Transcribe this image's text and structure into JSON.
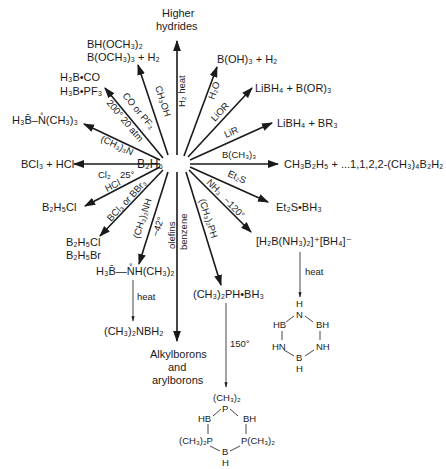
{
  "diagram": {
    "center": "B₂H₆",
    "accent_color": "#1a1a1a",
    "background_color": "#ffffff",
    "reactions": [
      {
        "id": "higher-hydrides",
        "condition": "H₂ heat",
        "product_line1": "Higher",
        "product_line2": "hydrides"
      },
      {
        "id": "methanol",
        "condition": "CH₃OH",
        "product_line1": "BH(OCH₃)₂",
        "product_line2": "B(OCH₃)₃ + H₂"
      },
      {
        "id": "carbonyl",
        "condition_line1": "CO or PF₃",
        "condition_line2": "200° 20 atm",
        "product_line1": "H₃B•CO",
        "product_line2": "H₃B•PF₃"
      },
      {
        "id": "trimethylamine",
        "condition": "(CH₃)₃N",
        "product": "H₃B̄–N̊(CH₃)₃"
      },
      {
        "id": "chlorine",
        "condition_line1": "Cl₂",
        "condition_line2": "25°",
        "product": "BCl₃ + HCl"
      },
      {
        "id": "hcl",
        "condition": "HCl",
        "product": "B₂H₅Cl"
      },
      {
        "id": "boron-halides",
        "condition": "BCl₃ or BBr₃",
        "product_line1": "B₂H₅Cl",
        "product_line2": "B₂H₅Br"
      },
      {
        "id": "dimethylamine",
        "condition_line1": "(CH₃)₂NH",
        "condition_line2": "−42°",
        "product": "H₃B̄—N̊H(CH₃)₂",
        "next_condition": "heat",
        "next_product": "(CH₃)₂NBH₂"
      },
      {
        "id": "olefins",
        "condition_line1": "olefins",
        "condition_line2": "benzene",
        "product_line1": "Alkylborons",
        "product_line2": "and",
        "product_line3": "arylborons"
      },
      {
        "id": "dimethylphosphine",
        "condition": "(CH₃)₂PH",
        "product": "(CH₃)₂PH•BH₃",
        "next_condition": "150°",
        "ring_labels": [
          "(CH₃)₂",
          "P",
          "HB",
          "BH",
          "(CH₃)₂P",
          "P(CH₃)₂",
          "B",
          "H"
        ]
      },
      {
        "id": "ammonia",
        "condition_line1": "NH₃",
        "condition_line2": "−120°",
        "product": "[H₂B(NH₃)₂]⁺[BH₄]⁻",
        "next_condition": "heat",
        "ring_labels": [
          "H",
          "N",
          "HB",
          "BH",
          "HN",
          "NH",
          "B",
          "H"
        ]
      },
      {
        "id": "diethylsulfide",
        "condition": "Et₂S",
        "product": "Et₂S•BH₃"
      },
      {
        "id": "trimethylboron",
        "condition": "B(CH₃)₃",
        "product": "CH₃B₂H₅ + ...1,1,2,2-(CH₃)₄B₂H₂"
      },
      {
        "id": "lir",
        "condition": "LiR",
        "product": "LiBH₄ + BR₃"
      },
      {
        "id": "lior",
        "condition": "LiOR",
        "product": "LiBH₄ + B(OR)₃"
      },
      {
        "id": "water",
        "condition": "H₂O",
        "product": "B(OH)₃ + H₂"
      }
    ]
  }
}
